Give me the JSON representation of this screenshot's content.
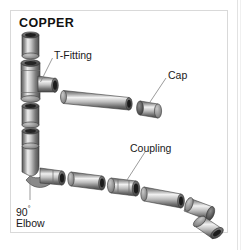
{
  "figure": {
    "title": "COPPER",
    "kind": "exploded technical illustration of copper plumbing pipe fittings",
    "background_color": "#ffffff",
    "frame_color": "#d9d9d9",
    "metal_light": "#e8e8e8",
    "metal_mid": "#9a9a9a",
    "metal_dark": "#4a4a4a",
    "metal_shadow": "#2e2e2e",
    "leader_color": "#7d7d7d"
  },
  "labels": {
    "t_fitting": "T-Fitting",
    "cap": "Cap",
    "coupling": "Coupling",
    "elbow_line1": "90",
    "elbow_degree": "°",
    "elbow_line2": "Elbow"
  },
  "parts": [
    {
      "name": "pipe-stub-top",
      "label": null
    },
    {
      "name": "t-fitting",
      "label": "T-Fitting"
    },
    {
      "name": "straight-pipe-long",
      "label": null
    },
    {
      "name": "cap",
      "label": "Cap"
    },
    {
      "name": "pipe-stub-middle",
      "label": null
    },
    {
      "name": "pipe-stub-lower",
      "label": null
    },
    {
      "name": "elbow-90",
      "label": "90° Elbow"
    },
    {
      "name": "pipe-segment-1",
      "label": null
    },
    {
      "name": "coupling",
      "label": "Coupling"
    },
    {
      "name": "pipe-segment-2",
      "label": null
    },
    {
      "name": "bend-fitting",
      "label": null
    },
    {
      "name": "end-cap-fitting",
      "label": null
    }
  ]
}
